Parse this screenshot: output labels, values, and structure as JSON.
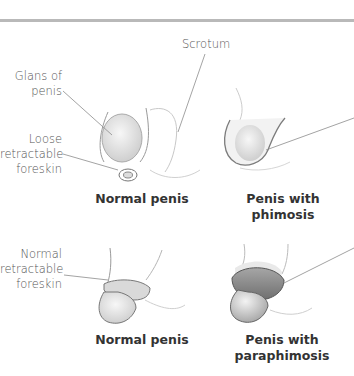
{
  "figure": {
    "labels": {
      "scrotum": "Scrotum",
      "glans_line1": "Glans of",
      "glans_line2": "penis",
      "loose_line1": "Loose",
      "loose_line2": "retractable",
      "loose_line3": "foreskin",
      "normal_line1": "Normal",
      "normal_line2": "retractable",
      "normal_line3": "foreskin"
    },
    "panels": [
      {
        "caption_line1": "Normal penis",
        "caption_line2": ""
      },
      {
        "caption_line1": "Penis with",
        "caption_line2": "phimosis"
      },
      {
        "caption_line1": "Normal penis",
        "caption_line2": ""
      },
      {
        "caption_line1": "Penis with",
        "caption_line2": "paraphimosis"
      }
    ],
    "colors": {
      "divider": "#b9b9b9",
      "leader_line": "#888888",
      "outline": "#8a8a8a",
      "skin_fill": "#f1f1f1",
      "swollen_ring": "#8f8f8f"
    }
  }
}
